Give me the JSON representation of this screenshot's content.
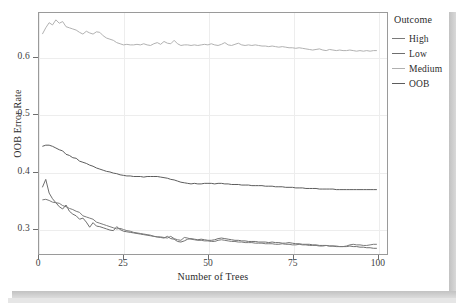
{
  "chart_data": {
    "type": "line",
    "title": "",
    "xlabel": "Number of Trees",
    "ylabel": "OOB Error Rate",
    "xlim": [
      0,
      103
    ],
    "ylim": [
      0.255,
      0.678
    ],
    "xticks": [
      0,
      25,
      50,
      75,
      100
    ],
    "yticks": [
      0.3,
      0.4,
      0.5,
      0.6
    ],
    "xtick_labels": [
      "0",
      "25",
      "50",
      "75",
      "100"
    ],
    "ytick_labels": [
      "0.3",
      "0.4",
      "0.5",
      "0.6"
    ],
    "grid": true,
    "legend": {
      "title": "Outcome",
      "position": "right",
      "entries": [
        "High",
        "Low",
        "Medium",
        "OOB"
      ]
    },
    "colors": {
      "High": "#7a7a7a",
      "Low": "#6e6e6e",
      "Medium": "#b0b0b0",
      "OOB": "#5c5c5c",
      "panel_border": "#9a9a9a",
      "grid": "#ededed",
      "axis_text": "#3d3d3d",
      "shadow": "#c8c8c8"
    },
    "series": [
      {
        "name": "High",
        "values": [
          0.35,
          0.351,
          0.349,
          0.346,
          0.345,
          0.344,
          0.34,
          0.338,
          0.335,
          0.333,
          0.33,
          0.328,
          0.322,
          0.32,
          0.318,
          0.316,
          0.311,
          0.309,
          0.307,
          0.305,
          0.303,
          0.301,
          0.299,
          0.3,
          0.298,
          0.296,
          0.295,
          0.293,
          0.292,
          0.291,
          0.29,
          0.289,
          0.288,
          0.286,
          0.285,
          0.285,
          0.284,
          0.283,
          0.286,
          0.282,
          0.28,
          0.279,
          0.284,
          0.283,
          0.281,
          0.28,
          0.279,
          0.279,
          0.278,
          0.278,
          0.277,
          0.277,
          0.279,
          0.28,
          0.279,
          0.278,
          0.277,
          0.277,
          0.276,
          0.276,
          0.275,
          0.275,
          0.275,
          0.274,
          0.274,
          0.274,
          0.273,
          0.273,
          0.273,
          0.272,
          0.272,
          0.273,
          0.272,
          0.272,
          0.271,
          0.271,
          0.272,
          0.271,
          0.271,
          0.27,
          0.27,
          0.27,
          0.269,
          0.269,
          0.27,
          0.269,
          0.269,
          0.269,
          0.268,
          0.268,
          0.269,
          0.271,
          0.272,
          0.271,
          0.271,
          0.27,
          0.27,
          0.271,
          0.272,
          0.272
        ]
      },
      {
        "name": "Low",
        "values": [
          0.372,
          0.386,
          0.362,
          0.352,
          0.345,
          0.338,
          0.334,
          0.341,
          0.33,
          0.325,
          0.322,
          0.316,
          0.318,
          0.311,
          0.302,
          0.31,
          0.304,
          0.303,
          0.301,
          0.299,
          0.297,
          0.296,
          0.303,
          0.298,
          0.295,
          0.294,
          0.293,
          0.292,
          0.291,
          0.29,
          0.289,
          0.288,
          0.287,
          0.286,
          0.285,
          0.284,
          0.283,
          0.286,
          0.282,
          0.281,
          0.277,
          0.276,
          0.278,
          0.281,
          0.282,
          0.281,
          0.28,
          0.281,
          0.28,
          0.279,
          0.279,
          0.28,
          0.282,
          0.283,
          0.282,
          0.281,
          0.28,
          0.279,
          0.279,
          0.278,
          0.278,
          0.277,
          0.277,
          0.277,
          0.276,
          0.276,
          0.276,
          0.275,
          0.276,
          0.275,
          0.275,
          0.274,
          0.274,
          0.275,
          0.274,
          0.273,
          0.273,
          0.272,
          0.272,
          0.272,
          0.271,
          0.271,
          0.27,
          0.27,
          0.27,
          0.269,
          0.269,
          0.268,
          0.268,
          0.268,
          0.268,
          0.269,
          0.268,
          0.268,
          0.267,
          0.267,
          0.266,
          0.266,
          0.265,
          0.265
        ]
      },
      {
        "name": "Medium",
        "values": [
          0.641,
          0.652,
          0.661,
          0.657,
          0.666,
          0.66,
          0.663,
          0.654,
          0.652,
          0.65,
          0.648,
          0.644,
          0.641,
          0.646,
          0.643,
          0.641,
          0.645,
          0.644,
          0.638,
          0.634,
          0.632,
          0.63,
          0.626,
          0.624,
          0.622,
          0.623,
          0.622,
          0.622,
          0.623,
          0.622,
          0.624,
          0.622,
          0.621,
          0.624,
          0.626,
          0.623,
          0.628,
          0.625,
          0.624,
          0.63,
          0.624,
          0.621,
          0.622,
          0.622,
          0.621,
          0.622,
          0.621,
          0.622,
          0.623,
          0.622,
          0.624,
          0.622,
          0.621,
          0.623,
          0.626,
          0.622,
          0.621,
          0.623,
          0.625,
          0.622,
          0.621,
          0.622,
          0.621,
          0.622,
          0.621,
          0.62,
          0.62,
          0.619,
          0.62,
          0.619,
          0.618,
          0.619,
          0.618,
          0.617,
          0.617,
          0.616,
          0.617,
          0.616,
          0.615,
          0.614,
          0.613,
          0.614,
          0.615,
          0.613,
          0.612,
          0.614,
          0.613,
          0.612,
          0.613,
          0.612,
          0.612,
          0.613,
          0.612,
          0.611,
          0.612,
          0.611,
          0.612,
          0.611,
          0.612,
          0.612
        ]
      },
      {
        "name": "OOB",
        "values": [
          0.444,
          0.446,
          0.446,
          0.444,
          0.441,
          0.438,
          0.436,
          0.43,
          0.428,
          0.424,
          0.423,
          0.418,
          0.416,
          0.414,
          0.411,
          0.409,
          0.406,
          0.404,
          0.402,
          0.4,
          0.399,
          0.397,
          0.396,
          0.394,
          0.393,
          0.392,
          0.392,
          0.391,
          0.391,
          0.391,
          0.39,
          0.391,
          0.391,
          0.391,
          0.391,
          0.39,
          0.389,
          0.388,
          0.386,
          0.385,
          0.383,
          0.381,
          0.38,
          0.379,
          0.378,
          0.379,
          0.378,
          0.378,
          0.379,
          0.379,
          0.379,
          0.378,
          0.379,
          0.379,
          0.378,
          0.378,
          0.377,
          0.377,
          0.377,
          0.376,
          0.376,
          0.376,
          0.375,
          0.375,
          0.375,
          0.375,
          0.374,
          0.374,
          0.374,
          0.373,
          0.373,
          0.373,
          0.372,
          0.372,
          0.372,
          0.371,
          0.371,
          0.371,
          0.37,
          0.37,
          0.37,
          0.37,
          0.369,
          0.369,
          0.369,
          0.369,
          0.369,
          0.368,
          0.368,
          0.368,
          0.368,
          0.368,
          0.368,
          0.368,
          0.368,
          0.368,
          0.368,
          0.368,
          0.368,
          0.368
        ]
      }
    ]
  }
}
